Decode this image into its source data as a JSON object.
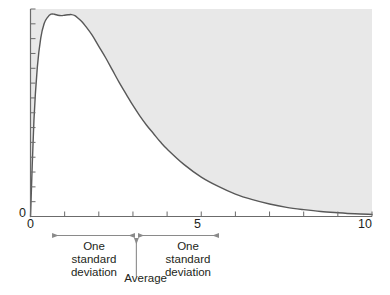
{
  "chart_data": {
    "type": "line",
    "title": "",
    "subtitle": "",
    "xlabel": "",
    "ylabel": "",
    "xlim": [
      0,
      10
    ],
    "ylim": [
      0,
      1
    ],
    "grid": false,
    "legend": null,
    "shaded_region": {
      "description": "area above the curve inside the plot frame",
      "color": "#e8e8e8"
    },
    "curve": {
      "name": "skewed probability density",
      "color": "#585858",
      "peak_x": 1.2,
      "peak_y": 0.97,
      "x": [
        0.0,
        0.1,
        0.2,
        0.3,
        0.4,
        0.5,
        0.6,
        0.7,
        0.8,
        0.9,
        1.0,
        1.1,
        1.2,
        1.3,
        1.4,
        1.5,
        1.6,
        1.8,
        2.0,
        2.2,
        2.4,
        2.6,
        2.8,
        3.0,
        3.2,
        3.4,
        3.6,
        3.8,
        4.0,
        4.5,
        5.0,
        5.5,
        6.0,
        6.5,
        7.0,
        7.5,
        8.0,
        8.5,
        9.0,
        9.5,
        10.0
      ],
      "y": [
        0.0,
        0.46,
        0.72,
        0.86,
        0.93,
        0.96,
        0.975,
        0.975,
        0.97,
        0.968,
        0.97,
        0.972,
        0.973,
        0.968,
        0.955,
        0.94,
        0.92,
        0.875,
        0.82,
        0.765,
        0.705,
        0.645,
        0.59,
        0.535,
        0.485,
        0.44,
        0.4,
        0.36,
        0.325,
        0.25,
        0.19,
        0.145,
        0.108,
        0.081,
        0.06,
        0.044,
        0.033,
        0.024,
        0.018,
        0.013,
        0.01
      ]
    },
    "x_ticks": [
      0,
      1,
      2,
      3,
      4,
      5,
      6,
      7,
      8,
      9,
      10
    ],
    "x_tick_labels": [
      {
        "value": 0,
        "label": "0"
      },
      {
        "value": 5,
        "label": "5"
      },
      {
        "value": 10,
        "label": "10"
      }
    ],
    "y_tick_labels": [
      {
        "value": 0,
        "label": "0"
      }
    ],
    "y_tick_count": 14,
    "annotations": {
      "average": {
        "label": "Average",
        "x_value": 3.1
      },
      "sd_left": {
        "label_lines": [
          "One",
          "standard",
          "deviation"
        ],
        "label": "One standard deviation",
        "from_x": 0.65,
        "to_x": 3.1
      },
      "sd_right": {
        "label_lines": [
          "One",
          "standard",
          "deviation"
        ],
        "label": "One standard deviation",
        "from_x": 3.1,
        "to_x": 5.5
      }
    },
    "colors": {
      "curve": "#585858",
      "shade": "#e8e8e8",
      "axis": "#6b6b6b",
      "annotation": "#8a8a8a",
      "text": "#231f20",
      "background": "#ffffff"
    }
  }
}
